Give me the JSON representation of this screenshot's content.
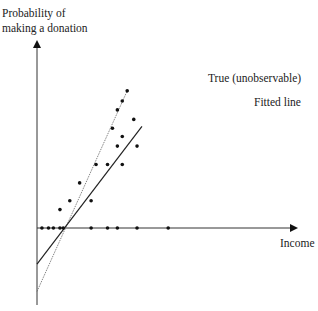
{
  "chart_data": {
    "type": "scatter",
    "title": "",
    "ylabel_lines": [
      "Probability of",
      "making a donation"
    ],
    "xlabel": "Income",
    "xlim": [
      0,
      100
    ],
    "ylim": [
      -1.0,
      3.0
    ],
    "grid": false,
    "points": [
      {
        "x": 3,
        "y": 0
      },
      {
        "x": 7,
        "y": 0
      },
      {
        "x": 10,
        "y": 0
      },
      {
        "x": 14,
        "y": 0
      },
      {
        "x": 16,
        "y": 0
      },
      {
        "x": 33,
        "y": 0
      },
      {
        "x": 43,
        "y": 0
      },
      {
        "x": 49,
        "y": 0
      },
      {
        "x": 61,
        "y": 0
      },
      {
        "x": 80,
        "y": 0
      },
      {
        "x": 14,
        "y": 0.29
      },
      {
        "x": 20,
        "y": 0.43
      },
      {
        "x": 33,
        "y": 0.43
      },
      {
        "x": 26,
        "y": 0.71
      },
      {
        "x": 36,
        "y": 1.0
      },
      {
        "x": 43,
        "y": 1.0
      },
      {
        "x": 52,
        "y": 1.0
      },
      {
        "x": 49,
        "y": 1.29
      },
      {
        "x": 52,
        "y": 1.44
      },
      {
        "x": 61,
        "y": 1.29
      },
      {
        "x": 46,
        "y": 1.57
      },
      {
        "x": 59,
        "y": 1.71
      },
      {
        "x": 49,
        "y": 1.86
      },
      {
        "x": 52,
        "y": 2.0
      },
      {
        "x": 55,
        "y": 2.16
      }
    ],
    "series": [
      {
        "name": "True (unobservable)",
        "style": "dotted-thin",
        "x": [
          0,
          55
        ],
        "y": [
          -1.0,
          2.16
        ]
      },
      {
        "name": "Fitted line",
        "style": "solid",
        "x": [
          0,
          64
        ],
        "y": [
          -0.57,
          1.6
        ]
      }
    ],
    "annotations": [
      {
        "text": "True (unobservable)",
        "near": "end of true line, upper-right"
      },
      {
        "text": "Fitted line",
        "near": "end of fitted line, right"
      }
    ]
  }
}
